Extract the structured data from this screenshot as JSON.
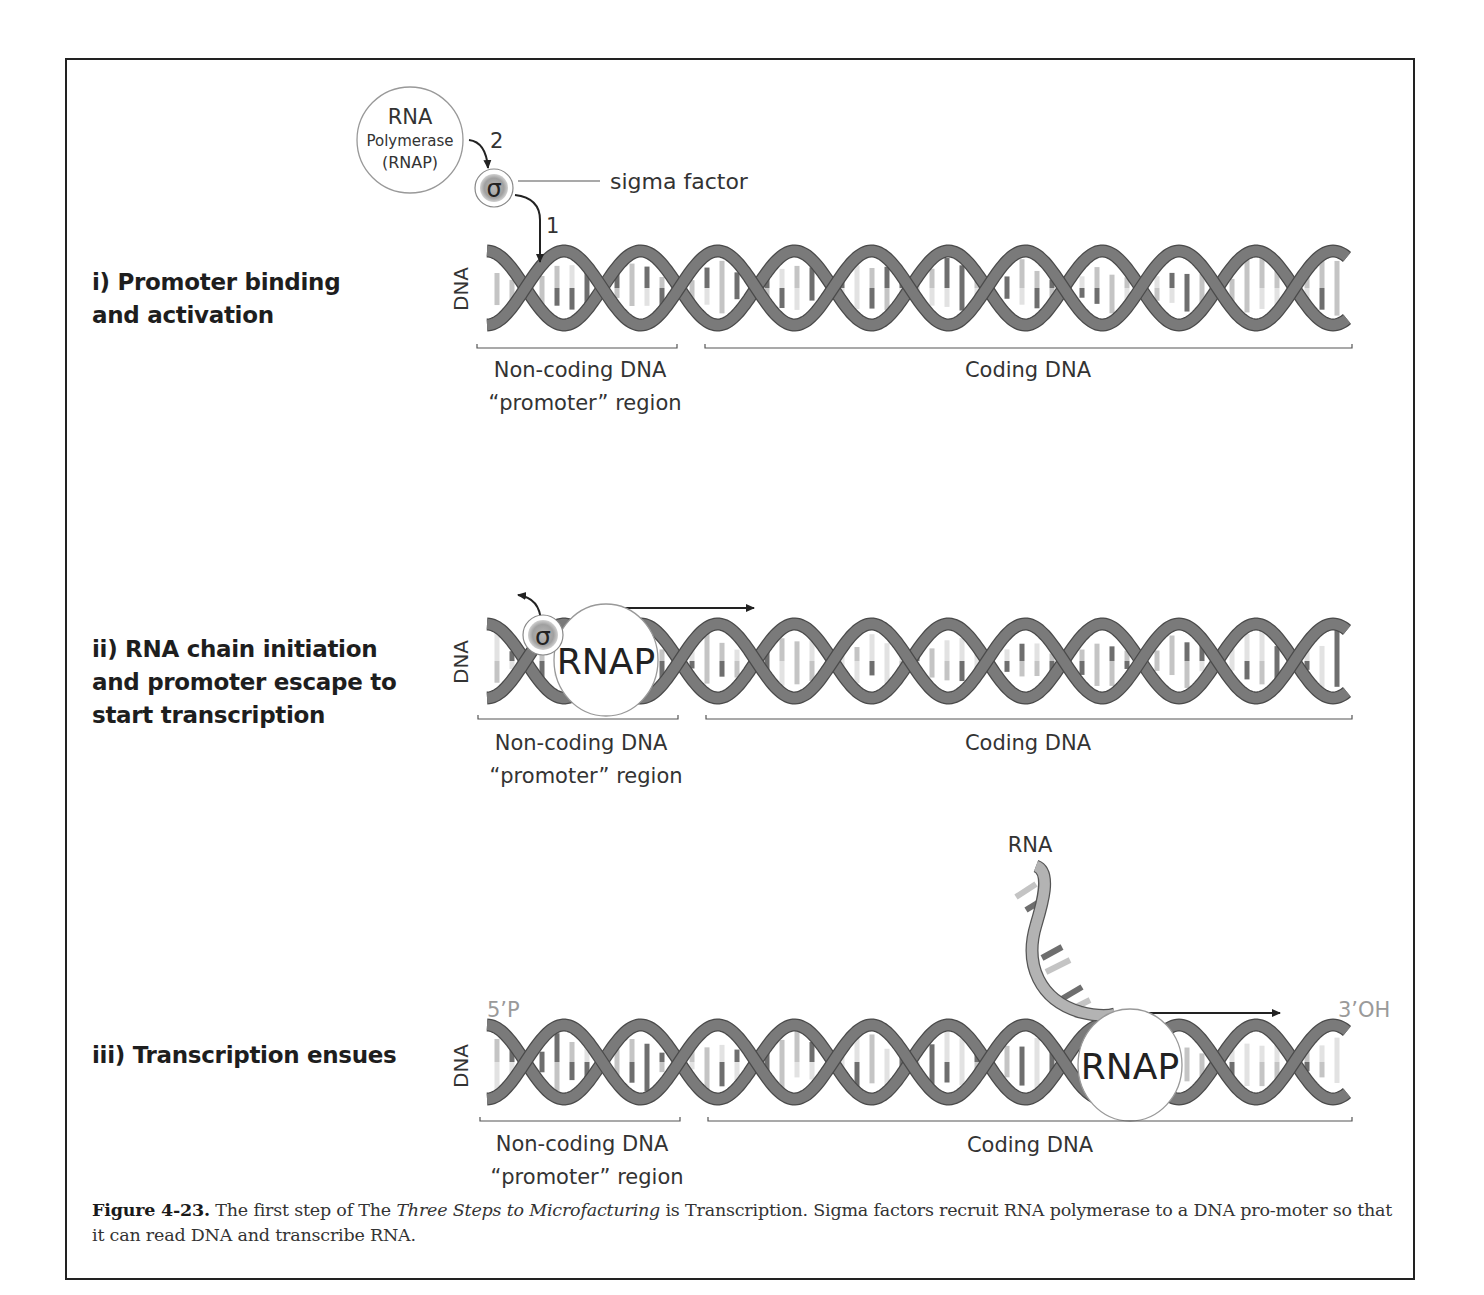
{
  "figure": {
    "panels": [
      {
        "id": "i",
        "step_label": "i) Promoter binding\nand activation",
        "dna_label": "DNA",
        "noncoding_label_line1": "Non-coding DNA",
        "noncoding_label_line2": "“promoter” region",
        "coding_label": "Coding DNA",
        "rnap_label_line1": "RNA",
        "rnap_label_line2": "Polymerase",
        "rnap_label_line3": "(RNAP)",
        "sigma_symbol": "σ",
        "sigma_callout": "sigma factor",
        "arrow_1_label": "1",
        "arrow_2_label": "2"
      },
      {
        "id": "ii",
        "step_label": "ii) RNA chain initiation\nand promoter escape to\nstart transcription",
        "dna_label": "DNA",
        "noncoding_label_line1": "Non-coding DNA",
        "noncoding_label_line2": "“promoter” region",
        "coding_label": "Coding DNA",
        "sigma_symbol": "σ",
        "rnap_label": "RNAP"
      },
      {
        "id": "iii",
        "step_label": "iii) Transcription ensues",
        "dna_label": "DNA",
        "noncoding_label_line1": "Non-coding DNA",
        "noncoding_label_line2": "“promoter” region",
        "coding_label": "Coding DNA",
        "rnap_label": "RNAP",
        "rna_label": "RNA",
        "five_prime_label": "5’P",
        "three_prime_label": "3’OH"
      }
    ],
    "caption": {
      "figure_number": "Figure 4-23.",
      "text_before_italic": " The first step of The ",
      "italic_title": "Three Steps to Microfacturing",
      "text_after_italic": " is Transcription. Sigma factors recruit RNA polymerase to a DNA pro-moter so that it can read DNA and transcribe RNA."
    },
    "colors": {
      "backbone": "#7a7a7a",
      "backbone_outline": "#4a4a4a",
      "base_dark": "#6e6e6e",
      "base_light": "#c4c4c4",
      "base_pale": "#e2e2e2",
      "rna_strand": "#b3b3b3",
      "sigma_fill": "#a9a9a9",
      "end_label": "#9a9a9a",
      "text": "#333333"
    }
  }
}
